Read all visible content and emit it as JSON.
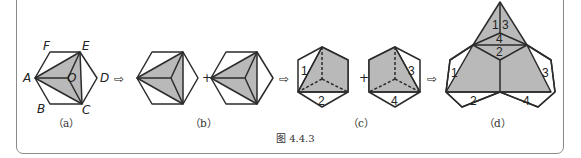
{
  "figure": {
    "caption": "图 4.4.3",
    "colors": {
      "stroke": "#2b2b2b",
      "fill_shaded": "#b9b9b9",
      "frame": "#8a8a8a"
    },
    "operators": {
      "arrow": "⇨",
      "plus": "+"
    },
    "panels": [
      {
        "id": "a",
        "label": "（a）",
        "vertex_labels": {
          "A": "A",
          "B": "B",
          "C": "C",
          "D": "D",
          "E": "E",
          "F": "F",
          "O": "O"
        },
        "description": "Regular hexagon ABCDEF with shaded tetrahedron net A-E-C-O"
      },
      {
        "id": "b",
        "label": "（b）",
        "description": "Two copies of the hexagon with shaded triangles"
      },
      {
        "id": "c",
        "label": "（c）",
        "face_numbers_left": [
          "1",
          "2"
        ],
        "face_numbers_right": [
          "3",
          "4"
        ],
        "description": "Two hexagons with dashed inner edges and numbered white triangles"
      },
      {
        "id": "d",
        "label": "（d）",
        "face_numbers_top": [
          "1",
          "3",
          "4",
          "2"
        ],
        "face_numbers_bottom": [
          "1",
          "2",
          "3",
          "4"
        ],
        "description": "Assembled large triangle with attached hexagon halves"
      }
    ]
  }
}
